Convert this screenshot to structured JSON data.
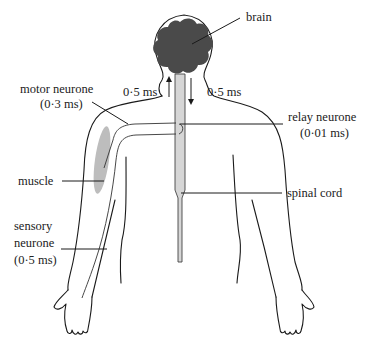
{
  "diagram": {
    "title_cut_off": true,
    "labels": {
      "brain": "brain",
      "motor_neurone": "motor neurone",
      "motor_neurone_time": "(0·3 ms)",
      "ascending_time": "0·5 ms",
      "descending_time": "0·5 ms",
      "relay_neurone": "relay neurone",
      "relay_neurone_time": "(0·01 ms)",
      "muscle": "muscle",
      "spinal_cord": "spinal cord",
      "sensory_line1": "sensory",
      "sensory_line2": "neurone",
      "sensory_time": "(0·5 ms)"
    },
    "colors": {
      "brain": "#4a4a4a",
      "spinal_cord": "#d6d6d6",
      "muscle": "#bdbdbd",
      "outline": "#1a1a1a"
    },
    "arrows": [
      {
        "name": "upward-arrow",
        "direction": "up"
      },
      {
        "name": "downward-arrow",
        "direction": "down"
      }
    ]
  }
}
